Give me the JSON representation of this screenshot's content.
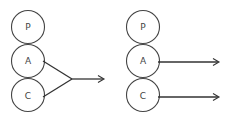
{
  "diagram": {
    "left_panel": {
      "nodes": [
        {
          "id": "P",
          "label": "P"
        },
        {
          "id": "A",
          "label": "A"
        },
        {
          "id": "C",
          "label": "C"
        }
      ],
      "description": "Outputs of A and C merge into a single arrow"
    },
    "right_panel": {
      "nodes": [
        {
          "id": "P",
          "label": "P"
        },
        {
          "id": "A",
          "label": "A"
        },
        {
          "id": "C",
          "label": "C"
        }
      ],
      "description": "A and C each have their own separate output arrow"
    },
    "colors": {
      "stroke": "#444444",
      "background": "#ffffff"
    }
  }
}
